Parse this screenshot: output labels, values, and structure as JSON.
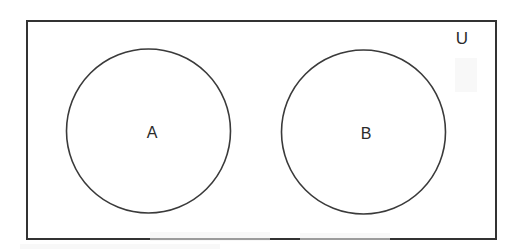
{
  "figure": {
    "type": "venn-diagram",
    "background_color": "#ffffff",
    "stroke_color": "#333333",
    "label_color": "#2b2b2b"
  },
  "universe": {
    "label": "U",
    "label_x": 462,
    "label_y": 40,
    "rect": {
      "x": 27,
      "y": 21,
      "width": 469,
      "height": 218
    }
  },
  "sets": [
    {
      "label": "A",
      "cx": 148.5,
      "cy": 131,
      "r": 82,
      "label_x": 152,
      "label_y": 134
    },
    {
      "label": "B",
      "cx": 363.5,
      "cy": 132,
      "r": 82,
      "label_x": 366,
      "label_y": 135
    }
  ],
  "relations": {
    "intersection": "empty",
    "description": "A and B do not overlap; both are subsets of U"
  }
}
